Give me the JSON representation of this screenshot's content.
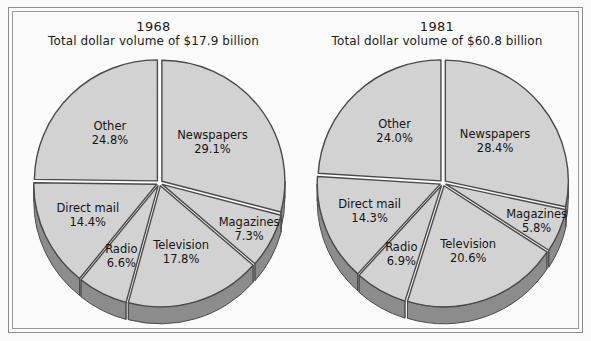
{
  "figure": {
    "background": "#fbfbfb",
    "frame_color": "#8d8d8d",
    "slice_fill": "#d2d2d2",
    "slice_edge": "#4a4a4a",
    "depth_fill": "#8c8c8c",
    "gap_color": "#ffffff"
  },
  "charts": [
    {
      "id": "chart-1968",
      "title_year": "1968",
      "title_sub": "Total dollar volume of $17.9 billion",
      "slices": [
        {
          "label": "Newspapers",
          "value": 29.1,
          "value_text": "29.1%"
        },
        {
          "label": "Magazines",
          "value": 7.3,
          "value_text": "7.3%"
        },
        {
          "label": "Television",
          "value": 17.8,
          "value_text": "17.8%"
        },
        {
          "label": "Radio",
          "value": 6.6,
          "value_text": "6.6%"
        },
        {
          "label": "Direct mail",
          "value": 14.4,
          "value_text": "14.4%"
        },
        {
          "label": "Other",
          "value": 24.8,
          "value_text": "24.8%"
        }
      ]
    },
    {
      "id": "chart-1981",
      "title_year": "1981",
      "title_sub": "Total dollar volume of $60.8 billion",
      "slices": [
        {
          "label": "Newspapers",
          "value": 28.4,
          "value_text": "28.4%"
        },
        {
          "label": "Magazines",
          "value": 5.8,
          "value_text": "5.8%"
        },
        {
          "label": "Television",
          "value": 20.6,
          "value_text": "20.6%"
        },
        {
          "label": "Radio",
          "value": 6.9,
          "value_text": "6.9%"
        },
        {
          "label": "Direct mail",
          "value": 14.3,
          "value_text": "14.3%"
        },
        {
          "label": "Other",
          "value": 24.0,
          "value_text": "24.0%"
        }
      ]
    }
  ],
  "chart_data": [
    {
      "type": "pie",
      "title": "1968 — Total dollar volume of $17.9 billion",
      "subtitle": "Total dollar volume of $17.9 billion",
      "total_label": "$17.9 billion",
      "categories": [
        "Newspapers",
        "Magazines",
        "Television",
        "Radio",
        "Direct mail",
        "Other"
      ],
      "values": [
        29.1,
        7.3,
        17.8,
        6.6,
        14.4,
        24.8
      ],
      "unit": "%",
      "legend": "none (labels inside slices)",
      "xlabel": "",
      "ylabel": ""
    },
    {
      "type": "pie",
      "title": "1981 — Total dollar volume of $60.8 billion",
      "subtitle": "Total dollar volume of $60.8 billion",
      "total_label": "$60.8 billion",
      "categories": [
        "Newspapers",
        "Magazines",
        "Television",
        "Radio",
        "Direct mail",
        "Other"
      ],
      "values": [
        28.4,
        5.8,
        20.6,
        6.9,
        14.3,
        24.0
      ],
      "unit": "%",
      "legend": "none (labels inside slices)",
      "xlabel": "",
      "ylabel": ""
    }
  ]
}
